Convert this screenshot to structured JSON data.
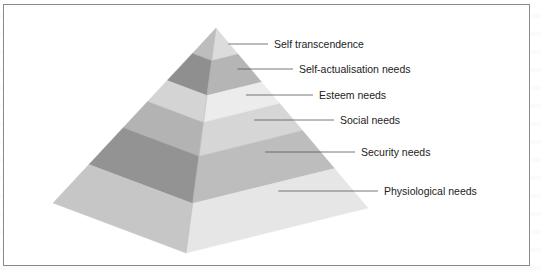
{
  "diagram": {
    "type": "pyramid",
    "title": "",
    "levels": [
      {
        "label": "Self transcendence",
        "rank": 1,
        "left_color": "#bdbdbd",
        "right_color": "#dcdcdc"
      },
      {
        "label": "Self-actualisation needs",
        "rank": 2,
        "left_color": "#8f8f8f",
        "right_color": "#b5b5b5"
      },
      {
        "label": "Esteem needs",
        "rank": 3,
        "left_color": "#d4d4d4",
        "right_color": "#ececec"
      },
      {
        "label": "Social needs",
        "rank": 4,
        "left_color": "#b3b3b3",
        "right_color": "#d6d6d6"
      },
      {
        "label": "Security needs",
        "rank": 5,
        "left_color": "#939393",
        "right_color": "#bdbdbd"
      },
      {
        "label": "Physiological needs",
        "rank": 6,
        "left_color": "#c6c6c6",
        "right_color": "#e6e6e6"
      }
    ]
  },
  "colors": {
    "frame_border": "#8a8a8a",
    "leader_line": "#555555",
    "label_text": "#222222",
    "background": "#ffffff"
  }
}
